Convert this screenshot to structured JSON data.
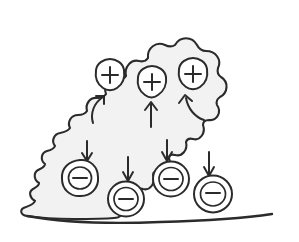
{
  "figure": {
    "type": "hand-drawn scientific diagram",
    "caption": "",
    "background_color": "#ffffff",
    "ink_color": "#2b2b2b",
    "cloud_fill_color": "#f2f2f2"
  },
  "cloud": {
    "label": "cloud",
    "fill_color": "#f2f2f2",
    "outline_color": "#2b2b2b",
    "texture": "fine stipple / halftone grid"
  },
  "positive_charges": [
    {
      "symbol": "+",
      "name": "positive-charge-left",
      "cx": 110,
      "cy": 75,
      "shape": "shield-hexagon"
    },
    {
      "symbol": "+",
      "name": "positive-charge-middle",
      "cx": 152,
      "cy": 82,
      "shape": "shield-hexagon"
    },
    {
      "symbol": "+",
      "name": "positive-charge-right",
      "cx": 193,
      "cy": 74,
      "shape": "shield-hexagon"
    }
  ],
  "negative_charges": [
    {
      "symbol": "−",
      "name": "negative-charge-1",
      "cx": 80,
      "cy": 178,
      "shape": "double-circle"
    },
    {
      "symbol": "−",
      "name": "negative-charge-2",
      "cx": 126,
      "cy": 199,
      "shape": "double-circle"
    },
    {
      "symbol": "−",
      "name": "negative-charge-3",
      "cx": 171,
      "cy": 179,
      "shape": "double-circle"
    },
    {
      "symbol": "−",
      "name": "negative-charge-4",
      "cx": 213,
      "cy": 194,
      "shape": "double-circle"
    }
  ],
  "up_arrows": [
    {
      "name": "up-arrow-left",
      "style": "curved"
    },
    {
      "name": "up-arrow-middle",
      "style": "straight"
    },
    {
      "name": "up-arrow-right",
      "style": "curved"
    }
  ],
  "down_arrows": [
    {
      "name": "down-arrow-1",
      "style": "straight"
    },
    {
      "name": "down-arrow-2",
      "style": "straight"
    },
    {
      "name": "down-arrow-3",
      "style": "straight"
    },
    {
      "name": "down-arrow-4",
      "style": "straight"
    }
  ],
  "counts": {
    "positive": 3,
    "negative": 4,
    "up_arrows": 3,
    "down_arrows": 4
  }
}
